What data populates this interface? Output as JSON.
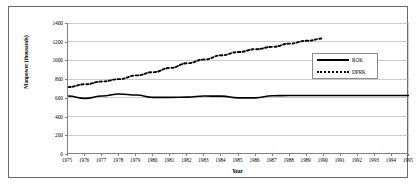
{
  "chart_data": {
    "type": "line",
    "title": "",
    "xlabel": "Year",
    "ylabel": "Manpower (thousands)",
    "xlim": [
      1975,
      1995
    ],
    "ylim": [
      0,
      1400
    ],
    "grid": true,
    "grid_axis": "y",
    "legend_position": "upper right",
    "x": [
      1975,
      1976,
      1977,
      1978,
      1979,
      1980,
      1981,
      1982,
      1983,
      1984,
      1985,
      1986,
      1987,
      1988,
      1989,
      1990,
      1991,
      1992,
      1993,
      1994,
      1995
    ],
    "xticklabels": [
      "1975",
      "1976",
      "1977",
      "1978",
      "1979",
      "1980",
      "1981",
      "1982",
      "1983",
      "1984",
      "1985",
      "1986",
      "1987",
      "1988",
      "1989",
      "1990",
      "1991",
      "1992",
      "1993",
      "1994",
      "1995"
    ],
    "yticks": [
      0,
      200,
      400,
      600,
      800,
      1000,
      1200,
      1400
    ],
    "yticklabels": [
      "0",
      "200",
      "400",
      "600",
      "800",
      "1000",
      "1200",
      "1400"
    ],
    "series": [
      {
        "name": "ROK",
        "style": "solid",
        "color": "#000000",
        "values": [
          620,
          595,
          620,
          642,
          630,
          605,
          605,
          608,
          620,
          618,
          600,
          600,
          622,
          625,
          625,
          625,
          625,
          625,
          625,
          625,
          625
        ]
      },
      {
        "name": "DPRK",
        "style": "dotted",
        "color": "#000000",
        "values": [
          715,
          745,
          775,
          800,
          840,
          875,
          920,
          970,
          1010,
          1055,
          1090,
          1120,
          1145,
          1180,
          1210,
          1235,
          null,
          null,
          null,
          null,
          null
        ]
      }
    ]
  },
  "legend": {
    "entries": [
      {
        "label": "ROK"
      },
      {
        "label": "DPRK"
      }
    ]
  },
  "axes": {
    "ylabel": "Manpower (thousands)",
    "xlabel": "Year"
  },
  "colors": {
    "line": "#000000",
    "grid": "#a8a8a8",
    "axis": "#808080",
    "frame": "#6b6b6b",
    "background": "#ffffff"
  }
}
